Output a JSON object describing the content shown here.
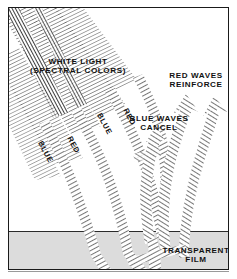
{
  "figure": {
    "colors": {
      "ink": "#111111",
      "frame": "#1a1a1a",
      "film_fill": "#dcdcdc",
      "hatch": "#555555",
      "paper": "#ffffff"
    }
  },
  "labels": {
    "white_light_line1": "WHITE LIGHT",
    "white_light_line2": "(SPECTRAL COLORS)",
    "red_reinforce_line1": "RED WAVES",
    "red_reinforce_line2": "REINFORCE",
    "blue_cancel_line1": "BLUE WAVES",
    "blue_cancel_line2": "CANCEL",
    "transparent_film_line1": "TRANSPARENT",
    "transparent_film_line2": "FILM"
  },
  "ray_labels": [
    {
      "text": "BLUE",
      "rotation_deg": 62
    },
    {
      "text": "RED",
      "rotation_deg": 62
    },
    {
      "text": "BLUE",
      "rotation_deg": 62
    },
    {
      "text": "RED",
      "rotation_deg": 62
    }
  ],
  "diagram_data": {
    "type": "physics-illustration",
    "subject": "thin film interference",
    "incoming_beam": {
      "origin": "upper-left",
      "direction_deg": 62,
      "description": "white light composed of spectral colors, drawn as parallel hatched bands"
    },
    "film_layer": {
      "label": "TRANSPARENT FILM",
      "position": "bottom band",
      "top_y": 223,
      "height": 39
    },
    "outgoing_rays": [
      {
        "color": "RED",
        "result": "REINFORCE",
        "side": "right",
        "arrowhead": true
      },
      {
        "color": "BLUE",
        "result": "CANCEL",
        "side": "center",
        "arrowhead": true
      }
    ],
    "incident_rays": [
      {
        "color": "BLUE",
        "index": 1
      },
      {
        "color": "RED",
        "index": 2
      },
      {
        "color": "BLUE",
        "index": 3
      },
      {
        "color": "RED",
        "index": 4
      }
    ]
  }
}
